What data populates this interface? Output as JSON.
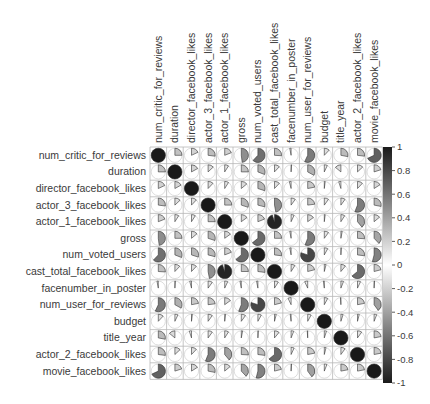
{
  "chart_data": {
    "type": "heatmap",
    "subtype": "correlation-pie-matrix",
    "title": "",
    "variables": [
      "num_critic_for_reviews",
      "duration",
      "director_facebook_likes",
      "actor_3_facebook_likes",
      "actor_1_facebook_likes",
      "gross",
      "num_voted_users",
      "cast_total_facebook_likes",
      "facenumber_in_poster",
      "num_user_for_reviews",
      "budget",
      "title_year",
      "actor_2_facebook_likes",
      "movie_facebook_likes"
    ],
    "matrix": [
      [
        1.0,
        0.25,
        0.18,
        0.27,
        0.19,
        0.48,
        0.62,
        0.26,
        -0.03,
        0.57,
        0.12,
        0.28,
        0.27,
        0.68
      ],
      [
        0.25,
        1.0,
        0.17,
        0.13,
        0.09,
        0.25,
        0.31,
        0.12,
        0.01,
        0.33,
        0.07,
        -0.14,
        0.13,
        0.2
      ],
      [
        0.18,
        0.17,
        1.0,
        0.12,
        0.09,
        0.14,
        0.3,
        0.12,
        -0.04,
        0.22,
        0.02,
        -0.05,
        0.12,
        0.16
      ],
      [
        0.27,
        0.13,
        0.12,
        1.0,
        0.25,
        0.3,
        0.29,
        0.47,
        0.1,
        0.23,
        0.1,
        0.1,
        0.56,
        0.28
      ],
      [
        0.19,
        0.09,
        0.09,
        0.25,
        1.0,
        0.15,
        0.19,
        0.95,
        0.07,
        0.15,
        0.02,
        0.09,
        0.39,
        0.14
      ],
      [
        0.48,
        0.25,
        0.14,
        0.3,
        0.15,
        1.0,
        0.64,
        0.25,
        -0.03,
        0.56,
        0.1,
        0.03,
        0.26,
        0.38
      ],
      [
        0.62,
        0.31,
        0.3,
        0.29,
        0.19,
        0.64,
        1.0,
        0.27,
        -0.03,
        0.8,
        0.08,
        0.01,
        0.27,
        0.54
      ],
      [
        0.26,
        0.12,
        0.12,
        0.47,
        0.95,
        0.25,
        0.27,
        1.0,
        0.09,
        0.21,
        0.04,
        0.11,
        0.64,
        0.21
      ],
      [
        -0.03,
        0.01,
        -0.04,
        0.1,
        0.07,
        -0.03,
        -0.03,
        0.09,
        1.0,
        -0.07,
        -0.02,
        0.06,
        0.07,
        0.01
      ],
      [
        0.57,
        0.33,
        0.22,
        0.23,
        0.15,
        0.56,
        0.8,
        0.21,
        -0.07,
        1.0,
        0.08,
        -0.01,
        0.22,
        0.4
      ],
      [
        0.12,
        0.07,
        0.02,
        0.1,
        0.02,
        0.1,
        0.08,
        0.04,
        -0.02,
        0.08,
        1.0,
        0.05,
        0.04,
        0.06
      ],
      [
        0.28,
        -0.14,
        -0.05,
        0.1,
        0.09,
        0.03,
        0.01,
        0.11,
        0.06,
        -0.01,
        0.05,
        1.0,
        0.1,
        0.22
      ],
      [
        0.27,
        0.13,
        0.12,
        0.56,
        0.39,
        0.26,
        0.27,
        0.64,
        0.07,
        0.22,
        0.04,
        0.1,
        1.0,
        0.22
      ],
      [
        0.68,
        0.2,
        0.16,
        0.28,
        0.14,
        0.38,
        0.54,
        0.21,
        0.01,
        0.4,
        0.06,
        0.22,
        0.22,
        1.0
      ]
    ],
    "colorbar": {
      "min": -1,
      "max": 1,
      "ticks": [
        "1",
        "0.8",
        "0.6",
        "0.4",
        "0.2",
        "0",
        "-0.2",
        "-0.4",
        "-0.6",
        "-0.8",
        "-1"
      ],
      "colormap": "grayscale-diverging (black at ±1, white at 0)"
    },
    "xlabel": "",
    "ylabel": "",
    "grid": true,
    "legend_position": "right (colorbar)"
  }
}
